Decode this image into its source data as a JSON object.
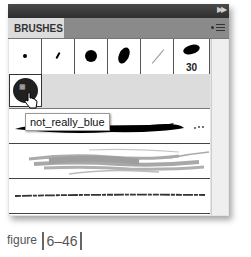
{
  "panel": {
    "title_tab": "BRUSHES",
    "collapse_icon": "double-chevron-right-icon",
    "menu_icon": "panel-menu-icon"
  },
  "brush_grid": {
    "cells": [
      {
        "name": "small-round-dot",
        "label": ""
      },
      {
        "name": "thin-angled-stroke",
        "label": ""
      },
      {
        "name": "round-blot",
        "label": ""
      },
      {
        "name": "oval-angled-blot",
        "label": ""
      },
      {
        "name": "thin-diagonal-line",
        "label": ""
      },
      {
        "name": "oval-calligraphic-30",
        "label": "30"
      }
    ]
  },
  "selected_brush": {
    "name": "not_really_blue",
    "tooltip": "not_really_blue"
  },
  "art_brushes": [
    {
      "name": "black-ink-art-brush"
    },
    {
      "name": "gray-chalk-art-brush"
    },
    {
      "name": "charcoal-line-art-brush"
    }
  ],
  "caption": {
    "prefix": "figure",
    "number": "6–46"
  }
}
